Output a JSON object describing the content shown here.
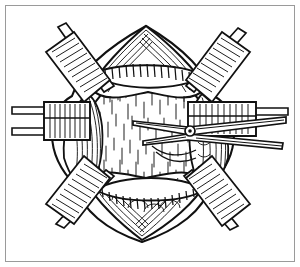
{
  "figure": {
    "kind": "line-art-illustration",
    "title": "Operative field exposed by six retractors with scissors dividing tissue",
    "style": "black ink pen-and-ink engraving, hatching and stipple shading",
    "background_color": "#ffffff",
    "ink_color": "#111111",
    "frame": {
      "present": true,
      "border_color": "#9a9a9a",
      "border_width_px": 1,
      "inset_px": 5,
      "fill_color": "#ffffff"
    },
    "center": {
      "x": 148,
      "y": 133
    },
    "cavity": {
      "label": "central-exposed-cavity",
      "fill_color": "#ffffff",
      "shading": "fine vertical dash stipple",
      "radius_x": 62,
      "radius_y": 58
    },
    "tissue_flaps": [
      {
        "name": "superior-tissue-flap",
        "position": "top",
        "apex": {
          "x": 146,
          "y": 28
        },
        "feature": "beaded segmented band across flap base",
        "texture": "parallel curved hatch lines"
      },
      {
        "name": "inferior-tissue-flap",
        "position": "bottom",
        "apex": {
          "x": 142,
          "y": 238
        },
        "feature": "scalloped layered tissue edge with beaded band",
        "texture": "arc hatching and scallops"
      },
      {
        "name": "left-tissue-margin",
        "position": "left",
        "texture": "dense vertical hatch"
      },
      {
        "name": "right-tissue-margin",
        "position": "right",
        "texture": "wavy rope-like hatch"
      }
    ],
    "instruments": [
      {
        "name": "retractor-upper-left",
        "type": "flat-blade-retractor",
        "position": "upper-left",
        "angle_deg": -40,
        "blade": {
          "x": 72,
          "y": 66,
          "w": 44,
          "h": 15
        },
        "handle_to": {
          "x": 60,
          "y": 29
        },
        "shading": "comb hatching"
      },
      {
        "name": "retractor-upper-right",
        "type": "flat-blade-retractor",
        "position": "upper-right",
        "angle_deg": 40,
        "blade": {
          "x": 186,
          "y": 62,
          "w": 44,
          "h": 15
        },
        "handle_to": {
          "x": 232,
          "y": 30
        },
        "shading": "comb hatching"
      },
      {
        "name": "retractor-left",
        "type": "flat-blade-retractor",
        "position": "left",
        "angle_deg": 0,
        "blade": {
          "x": 42,
          "y": 105,
          "w": 48,
          "h": 24
        },
        "handle_to": {
          "x": 12,
          "y": 112
        },
        "shading": "vertical hatching"
      },
      {
        "name": "retractor-right",
        "type": "flat-blade-retractor",
        "position": "right",
        "angle_deg": 0,
        "blade": {
          "x": 188,
          "y": 106,
          "w": 52,
          "h": 22
        },
        "handle_to": {
          "x": 266,
          "y": 116
        },
        "shading": "vertical hatching"
      },
      {
        "name": "retractor-lower-left",
        "type": "flat-blade-retractor",
        "position": "lower-left",
        "angle_deg": 38,
        "blade": {
          "x": 74,
          "y": 178,
          "w": 46,
          "h": 16
        },
        "handle_to": {
          "x": 58,
          "y": 220
        },
        "shading": "comb hatching"
      },
      {
        "name": "retractor-lower-right",
        "type": "flat-blade-retractor",
        "position": "lower-right",
        "angle_deg": -38,
        "blade": {
          "x": 184,
          "y": 180,
          "w": 46,
          "h": 16
        },
        "handle_to": {
          "x": 236,
          "y": 222
        },
        "shading": "comb hatching"
      },
      {
        "name": "surgical-scissors",
        "type": "scissors",
        "position": "center-right",
        "pivot": {
          "x": 190,
          "y": 131,
          "r": 4
        },
        "blade_tip": {
          "x": 133,
          "y": 122
        },
        "lower_blade_tip": {
          "x": 143,
          "y": 140
        },
        "shank_end": {
          "x": 286,
          "y": 120
        },
        "lower_shank_end": {
          "x": 283,
          "y": 147
        },
        "detail": "open blades with visible pivot screw, dividing tissue at center"
      }
    ],
    "hatch_groups": [
      {
        "name": "cavity-stipple",
        "count": 120
      },
      {
        "name": "flap-hatching",
        "count": 90
      },
      {
        "name": "retractor-comb-hatching",
        "count": 110
      }
    ]
  }
}
